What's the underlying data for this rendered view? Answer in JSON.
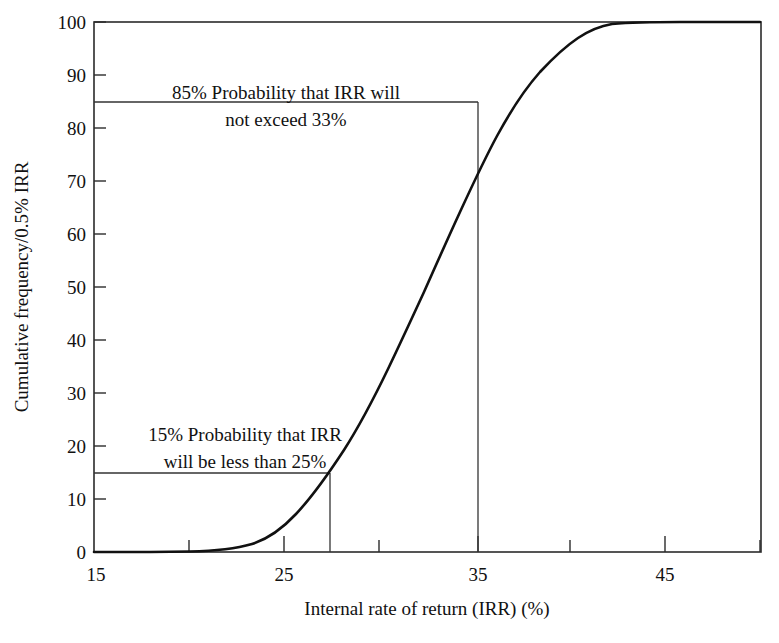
{
  "chart_data": {
    "type": "line",
    "title": "",
    "subtitle": "",
    "xlabel": "Internal rate of return (IRR) (%)",
    "ylabel": "Cumulative frequency/0.5% IRR",
    "xlim": [
      15,
      50
    ],
    "ylim": [
      0,
      100
    ],
    "grid": false,
    "legend": null,
    "legend_position": "none",
    "x_major_ticks": [
      15,
      25,
      35,
      45
    ],
    "x_major_tick_labels": [
      "15",
      "25",
      "35",
      "45"
    ],
    "x_minor_ticks": [
      20,
      30,
      40,
      50
    ],
    "y_major_ticks": [
      0,
      10,
      20,
      30,
      40,
      50,
      60,
      70,
      80,
      90,
      100
    ],
    "y_major_tick_labels": [
      "0",
      "10",
      "20",
      "30",
      "40",
      "50",
      "60",
      "70",
      "80",
      "90",
      "100"
    ],
    "series": [
      {
        "name": "Cumulative frequency of IRR",
        "x": [
          15,
          16,
          17,
          18,
          19,
          20,
          21,
          22,
          23,
          24,
          25,
          26,
          27,
          28,
          29,
          30,
          31,
          32,
          33,
          34,
          35,
          36,
          37,
          38,
          39,
          40,
          41,
          42,
          43,
          44,
          45,
          46,
          47,
          48,
          49,
          50
        ],
        "values": [
          0,
          0,
          0,
          0,
          0,
          0.2,
          0.6,
          1.5,
          3.2,
          6.2,
          10.0,
          13.0,
          15.0,
          23.0,
          31.0,
          40.0,
          50.0,
          60.0,
          69.0,
          77.5,
          85.0,
          90.5,
          94.5,
          97.0,
          98.6,
          99.5,
          100,
          100,
          100,
          100,
          100,
          100,
          100,
          100,
          100,
          100
        ]
      }
    ],
    "annotations": [
      {
        "id": "upper-annotation",
        "lines": [
          "85% Probability that IRR will",
          "not exceed 33%"
        ],
        "y_level": 85,
        "x_marker": 35,
        "leader": "horizontal-from-axis-to-curve-then-vertical-down"
      },
      {
        "id": "lower-annotation",
        "lines": [
          "15% Probability that IRR",
          "will be less than 25%"
        ],
        "y_level": 15,
        "x_marker": 27,
        "leader": "horizontal-from-axis-to-curve-then-vertical-down"
      }
    ]
  },
  "axes": {
    "y_axis_title": "Cumulative frequency/0.5% IRR",
    "x_axis_title": "Internal rate of return (IRR) (%)"
  },
  "y_labels": {
    "l0": "0",
    "l10": "10",
    "l20": "20",
    "l30": "30",
    "l40": "40",
    "l50": "50",
    "l60": "60",
    "l70": "70",
    "l80": "80",
    "l90": "90",
    "l100": "100"
  },
  "x_labels": {
    "x15": "15",
    "x25": "25",
    "x35": "35",
    "x45": "45"
  },
  "annotation_upper": {
    "line1": "85% Probability that IRR will",
    "line2": "not exceed 33%"
  },
  "annotation_lower": {
    "line1": "15% Probability that IRR",
    "line2": "will be less than 25%"
  },
  "colors": {
    "curve": "#111111",
    "frame": "#2b2b2b",
    "text": "#111111",
    "background": "#ffffff"
  }
}
